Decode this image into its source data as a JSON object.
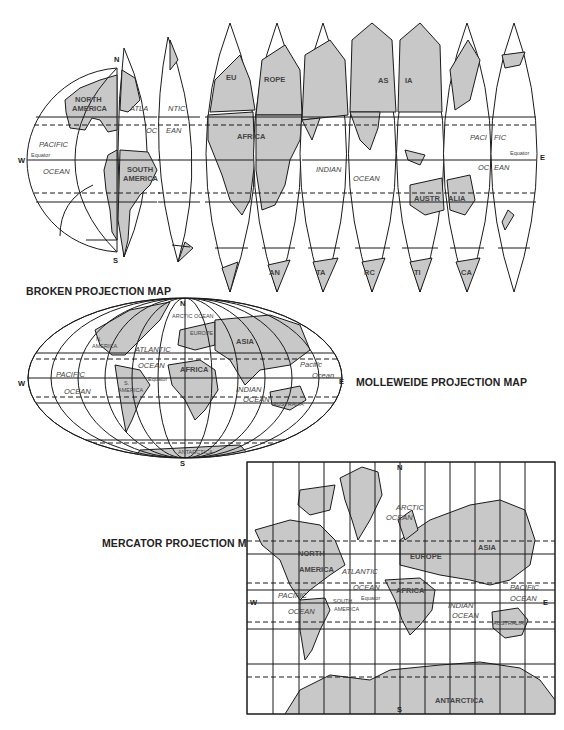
{
  "maps": {
    "broken": {
      "title": "BROKEN PROJECTION MAP",
      "directions": {
        "north": "N",
        "south": "S",
        "west": "W",
        "east": "E"
      },
      "equator_label": "Equator",
      "labels": {
        "north_america_1": "NORTH",
        "north_america_2": "AMERICA",
        "south_america_1": "SOUTH",
        "south_america_2": "AMERICA",
        "atlantic_a": "ATLA",
        "atlantic_b": "NTIC",
        "ocean_a": "OC",
        "ocean_b": "EAN",
        "pacific_w": "PACIFIC",
        "ocean_w": "OCEAN",
        "europe_a": "EU",
        "europe_b": "ROPE",
        "africa": "AFRICA",
        "asia_a": "AS",
        "asia_b": "IA",
        "indian": "INDIAN",
        "indian_ocean": "OCEAN",
        "pacific_e_a": "PACI",
        "pacific_e_b": "FIC",
        "ocean_e_a": "OC",
        "ocean_e_b": "EAN",
        "australia_a": "AUSTR",
        "australia_b": "ALIA",
        "antarctica": [
          "AN",
          "TA",
          "RC",
          "TI",
          "CA"
        ]
      }
    },
    "molleweide": {
      "title": "MOLLEWEIDE PROJECTION MAP",
      "directions": {
        "north": "N",
        "south": "S",
        "west": "W",
        "east": "E"
      },
      "equator_label": "Equator",
      "labels": {
        "arctic_ocean": "ARCTIC OCEAN",
        "europe": "EUROPE",
        "asia": "ASIA",
        "n_america_1": "N.",
        "n_america_2": "AMERICA",
        "atlantic": "ATLANTIC",
        "atlantic_ocean": "OCEAN",
        "africa": "AFRICA",
        "pacific_w": "PACIFIC",
        "ocean_w": "OCEAN",
        "s_america_1": "S.",
        "s_america_2": "AMERICA",
        "indian": "INDIAN",
        "indian_ocean": "OCEAN",
        "pacific_e": "Pacific",
        "ocean_e": "Ocean",
        "australia": "AUSTRALIA",
        "antarctica": "ANTARCTICA"
      }
    },
    "mercator": {
      "title": "MERCATOR PROJECTION MAP",
      "directions": {
        "north": "N",
        "south": "S",
        "west": "W",
        "east": "E"
      },
      "equator_label": "Equator",
      "labels": {
        "arctic": "ARCTIC",
        "arctic_ocean": "OCEAN",
        "north_america_1": "NORTH",
        "north_america_2": "AMERICA",
        "atlantic": "ATLANTIC",
        "atlantic_ocean": "OCEAN",
        "europe": "EUROPE",
        "asia": "ASIA",
        "africa": "AFRICA",
        "pacific_w": "PACIFIC",
        "ocean_w": "OCEAN",
        "south_america_1": "SOUTH",
        "south_america_2": "AMERICA",
        "indian": "INDIAN",
        "indian_ocean": "OCEAN",
        "pacific_e": "PACIFIC",
        "pacific_e_ocean": "OCEAN",
        "australia": "AUSTRALIA",
        "antarctica": "ANTARCTICA"
      }
    }
  },
  "colors": {
    "land": "#c8c8c8",
    "outline": "#1a1a1a",
    "water": "#ffffff"
  }
}
